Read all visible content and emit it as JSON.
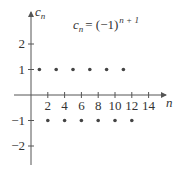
{
  "chart_data": {
    "type": "scatter",
    "formula": {
      "lhs": "c",
      "lhs_sub": "n",
      "rhs": "= (−1)",
      "rhs_sup": "n + 1"
    },
    "xlabel": "n",
    "ylabel": "c_n",
    "ylabel_parts": {
      "main": "c",
      "sub": "n"
    },
    "xlim": [
      0,
      16
    ],
    "ylim": [
      -2.8,
      3
    ],
    "xticks": [
      2,
      4,
      6,
      8,
      10,
      12,
      14
    ],
    "xtick_labels": [
      "2",
      "4",
      "6",
      "8",
      "10",
      "12",
      "14"
    ],
    "yticks": [
      2,
      1,
      -1,
      -2
    ],
    "ytick_labels": [
      "2",
      "1",
      "−1",
      "−2"
    ],
    "grid": false,
    "x": [
      1,
      2,
      3,
      4,
      5,
      6,
      7,
      8,
      9,
      10,
      11,
      12
    ],
    "values": [
      1,
      -1,
      1,
      -1,
      1,
      -1,
      1,
      -1,
      1,
      -1,
      1,
      -1
    ],
    "point_color": "#444444",
    "axis_color": "#555555"
  }
}
